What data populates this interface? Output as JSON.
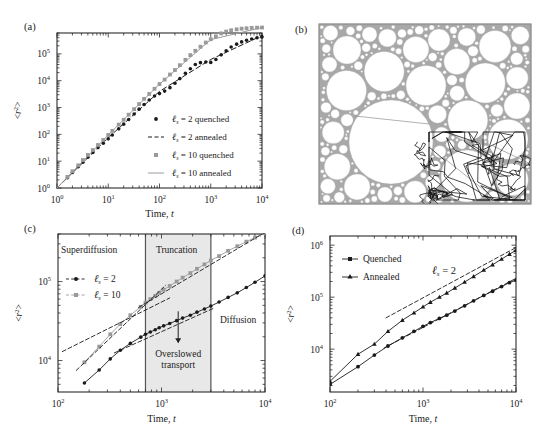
{
  "figure": {
    "panels": [
      "a",
      "b",
      "c",
      "d"
    ],
    "labels": {
      "a": "(a)",
      "b": "(b)",
      "c": "(c)",
      "d": "(d)"
    },
    "colors": {
      "black": "#1a1a1a",
      "gray": "#9a9a9a",
      "shade": "#e8e8e8",
      "axis": "#2b2b2b",
      "packing": "#a8a8a8"
    }
  },
  "panel_a": {
    "label": "(a)",
    "xlabel_main": "Time,",
    "xlabel_italic": "t",
    "ylabel": "<r2>",
    "xticks": [
      "100",
      "101",
      "102",
      "103",
      "104"
    ],
    "xtick_base": [
      "10",
      "10",
      "10",
      "10",
      "10"
    ],
    "xtick_exp": [
      "0",
      "1",
      "2",
      "3",
      "4"
    ],
    "ytick_base": [
      "10",
      "10",
      "10",
      "10",
      "10",
      "10"
    ],
    "ytick_exp": [
      "0",
      "1",
      "2",
      "3",
      "4",
      "5"
    ],
    "legend": [
      {
        "symbol": "filled-circle",
        "color": "#1a1a1a",
        "text_l": "ℓ",
        "text_sub": "s",
        "text": " = 2 quenched"
      },
      {
        "symbol": "dashed-line",
        "color": "#1a1a1a",
        "text_l": "ℓ",
        "text_sub": "s",
        "text": " = 2 annealed"
      },
      {
        "symbol": "filled-square",
        "color": "#9a9a9a",
        "text_l": "ℓ",
        "text_sub": "s",
        "text": " = 10 quenched"
      },
      {
        "symbol": "solid-line",
        "color": "#9a9a9a",
        "text_l": "ℓ",
        "text_sub": "s",
        "text": " = 10 annealed"
      }
    ]
  },
  "panel_b": {
    "label": "(b)",
    "description": "apollonian-disc-packing-with-trajectory"
  },
  "panel_c": {
    "label": "(c)",
    "xlabel_main": "Time,",
    "xlabel_italic": "t",
    "ylabel": "<r2>",
    "xtick_base": [
      "10",
      "10",
      "10"
    ],
    "xtick_exp": [
      "2",
      "3",
      "4"
    ],
    "ytick_base": [
      "10",
      "10"
    ],
    "ytick_exp": [
      "4",
      "5"
    ],
    "regions": [
      {
        "name": "Superdiffusion",
        "label": "Superdiffusion"
      },
      {
        "name": "Truncation",
        "label": "Truncation"
      },
      {
        "name": "Diffusion",
        "label": "Diffusion"
      }
    ],
    "annotation": {
      "line1": "Overslowed",
      "line2": "transport"
    },
    "legend": [
      {
        "symbol": "line-circle",
        "color": "#1a1a1a",
        "text_l": "ℓ",
        "text_sub": "s",
        "text": " = 2"
      },
      {
        "symbol": "line-square",
        "color": "#9a9a9a",
        "text_l": "ℓ",
        "text_sub": "s",
        "text": " = 10"
      }
    ]
  },
  "panel_d": {
    "label": "(d)",
    "xlabel_main": "Time,",
    "xlabel_italic": "t",
    "ylabel": "<r2>",
    "xtick_base": [
      "10",
      "10",
      "10"
    ],
    "xtick_exp": [
      "2",
      "3",
      "4"
    ],
    "ytick_base": [
      "10",
      "10",
      "10"
    ],
    "ytick_exp": [
      "4",
      "5",
      "6"
    ],
    "annotation": {
      "text_l": "ℓ",
      "text_sub": "s",
      "text": " = 2"
    },
    "legend": [
      {
        "symbol": "line-square",
        "color": "#1a1a1a",
        "text": "Quenched"
      },
      {
        "symbol": "line-triangle",
        "color": "#1a1a1a",
        "text": "Annealed"
      }
    ]
  },
  "chart_data": [
    {
      "panel": "a",
      "type": "scatter",
      "title": "",
      "xlabel": "Time, t",
      "ylabel": "<r^2>",
      "xscale": "log",
      "yscale": "log",
      "xlim": [
        1,
        10000
      ],
      "ylim": [
        1,
        600000
      ],
      "grid": false,
      "legend_position": "lower-right",
      "series": [
        {
          "name": "l_s = 2 quenched",
          "style": "points-circle",
          "color": "#1a1a1a",
          "x": [
            1.6,
            2,
            2.6,
            3.2,
            4,
            5,
            6.3,
            8,
            10,
            12,
            16,
            20,
            25,
            32,
            40,
            50,
            63,
            80,
            100,
            126,
            160,
            200,
            250,
            320,
            400,
            500,
            630,
            800,
            1000,
            1260,
            1600,
            2000,
            2500,
            3200,
            4000,
            5000,
            6300,
            8000,
            10000
          ],
          "y": [
            2.4,
            3.8,
            6.2,
            9.2,
            14,
            21,
            32,
            47,
            68,
            95,
            160,
            240,
            360,
            570,
            870,
            1300,
            1900,
            2700,
            3300,
            4100,
            5500,
            8000,
            12000,
            19000,
            28000,
            40000,
            47000,
            50000,
            48000,
            62000,
            92000,
            130000,
            180000,
            230000,
            280000,
            320000,
            360000,
            400000,
            430000
          ]
        },
        {
          "name": "l_s = 2 annealed",
          "style": "dashed",
          "color": "#1a1a1a",
          "x": [
            1,
            10,
            100,
            1000,
            10000
          ],
          "y": [
            1,
            75,
            4000,
            62000,
            480000
          ]
        },
        {
          "name": "l_s = 10 quenched",
          "style": "points-square",
          "color": "#9a9a9a",
          "x": [
            1.6,
            2,
            2.6,
            3.2,
            4,
            5,
            6.3,
            8,
            10,
            12,
            16,
            20,
            25,
            32,
            40,
            50,
            63,
            80,
            100,
            126,
            160,
            200,
            250,
            320,
            400,
            500,
            630,
            800,
            1000,
            1260,
            1600,
            2000,
            2500,
            3200,
            4000,
            5000,
            6300,
            8000,
            10000
          ],
          "y": [
            2.6,
            4.2,
            7,
            11,
            17,
            26,
            40,
            62,
            95,
            135,
            230,
            350,
            540,
            870,
            1350,
            2100,
            3200,
            5000,
            7500,
            11000,
            17000,
            25000,
            38000,
            60000,
            90000,
            130000,
            185000,
            265000,
            350000,
            450000,
            580000,
            680000,
            760000,
            820000,
            870000,
            900000,
            930000,
            950000,
            960000
          ]
        },
        {
          "name": "l_s = 10 annealed",
          "style": "solid",
          "color": "#9a9a9a",
          "x": [
            1,
            10,
            100,
            1000,
            10000
          ],
          "y": [
            1,
            95,
            7500,
            340000,
            960000
          ]
        }
      ]
    },
    {
      "panel": "c",
      "type": "line",
      "xlabel": "Time, t",
      "ylabel": "<r^2>",
      "xscale": "log",
      "yscale": "log",
      "xlim": [
        100,
        10000
      ],
      "ylim": [
        4000,
        400000
      ],
      "grid": false,
      "shaded_region": {
        "label": "Truncation",
        "xmin": 700,
        "xmax": 3000
      },
      "region_labels": [
        {
          "text": "Superdiffusion",
          "x": 200,
          "y": 230000
        },
        {
          "text": "Truncation",
          "x": 1400,
          "y": 230000
        },
        {
          "text": "Diffusion",
          "x": 5500,
          "y": 30000
        }
      ],
      "arrow_annotation": {
        "text": "Overslowed transport",
        "x": 1450,
        "ytop": 42000,
        "ybot": 17000
      },
      "series": [
        {
          "name": "l_s = 2",
          "style": "points-circle",
          "color": "#1a1a1a",
          "x": [
            180,
            250,
            320,
            400,
            500,
            630,
            700,
            780,
            870,
            950,
            1050,
            1200,
            1400,
            1600,
            1900,
            2200,
            2600,
            3000,
            3600,
            4400,
            5400,
            6600,
            8000,
            10000
          ],
          "y": [
            5200,
            7600,
            10500,
            13500,
            16500,
            19800,
            21500,
            23000,
            24500,
            26000,
            27500,
            29500,
            32000,
            34500,
            37500,
            41000,
            45000,
            49000,
            55000,
            63000,
            72000,
            84000,
            98000,
            118000
          ]
        },
        {
          "name": "l_s = 10",
          "style": "points-square",
          "color": "#9a9a9a",
          "x": [
            180,
            250,
            320,
            400,
            500,
            630,
            700,
            780,
            870,
            950,
            1050,
            1200,
            1400,
            1600,
            1900,
            2200,
            2600,
            3000,
            3600,
            4400,
            5400,
            6600,
            8000,
            10000
          ],
          "y": [
            9500,
            15000,
            21500,
            29000,
            37500,
            48000,
            54000,
            60000,
            66000,
            72000,
            79000,
            88000,
            100000,
            112000,
            128000,
            145000,
            165000,
            185000,
            210000,
            245000,
            280000,
            320000,
            360000,
            410000
          ]
        },
        {
          "name": "asymptote-upper-early",
          "style": "dashed",
          "color": "#1a1a1a",
          "x": [
            150,
            1100
          ],
          "y": [
            7500,
            90000
          ]
        },
        {
          "name": "asymptote-upper-late",
          "style": "dashed",
          "color": "#1a1a1a",
          "x": [
            600,
            10000
          ],
          "y": [
            47000,
            420000
          ]
        },
        {
          "name": "asymptote-lower-early",
          "style": "dashed",
          "color": "#1a1a1a",
          "x": [
            110,
            1200
          ],
          "y": [
            13000,
            62000
          ]
        },
        {
          "name": "asymptote-lower-late",
          "style": "dashed",
          "color": "#1a1a1a",
          "x": [
            350,
            3200
          ],
          "y": [
            12500,
            46000
          ]
        }
      ]
    },
    {
      "panel": "d",
      "type": "line",
      "xlabel": "Time, t",
      "ylabel": "<r^2>",
      "xscale": "log",
      "yscale": "log",
      "xlim": [
        100,
        10000
      ],
      "ylim": [
        1500,
        1500000
      ],
      "grid": false,
      "annotation": "l_s = 2",
      "legend_position": "upper-left",
      "series": [
        {
          "name": "Quenched",
          "style": "points-circle",
          "color": "#1a1a1a",
          "x": [
            100,
            200,
            300,
            420,
            600,
            800,
            1000,
            1200,
            1500,
            1800,
            2200,
            2800,
            3500,
            4500,
            5600,
            7000,
            8500,
            10000
          ],
          "y": [
            2100,
            4600,
            7700,
            11500,
            16500,
            22000,
            27500,
            32500,
            39000,
            45000,
            54000,
            68000,
            85000,
            108000,
            130000,
            160000,
            190000,
            215000
          ]
        },
        {
          "name": "Annealed",
          "style": "points-triangle",
          "color": "#1a1a1a",
          "x": [
            100,
            200,
            300,
            420,
            600,
            800,
            1000,
            1200,
            1500,
            1800,
            2200,
            2800,
            3500,
            4500,
            5600,
            7000,
            8500,
            10000
          ],
          "y": [
            2400,
            8000,
            12500,
            22000,
            36000,
            50000,
            65000,
            80000,
            100000,
            120000,
            150000,
            195000,
            250000,
            330000,
            420000,
            540000,
            670000,
            800000
          ]
        },
        {
          "name": "annealed-asymptote",
          "style": "dashed",
          "color": "#1a1a1a",
          "x": [
            400,
            10000
          ],
          "y": [
            40000,
            900000
          ]
        },
        {
          "name": "quenched-asymptote",
          "style": "dashed",
          "color": "#1a1a1a",
          "x": [
            380,
            10000
          ],
          "y": [
            10500,
            230000
          ]
        }
      ]
    }
  ]
}
